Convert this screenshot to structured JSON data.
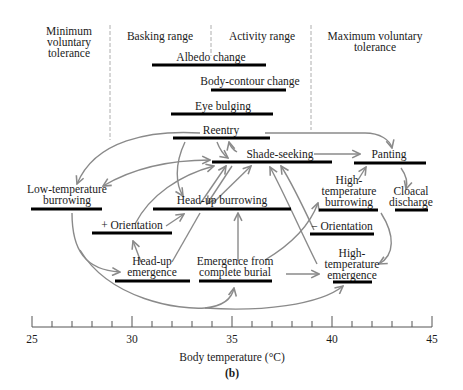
{
  "figure": {
    "panel_label": "(b)",
    "xlabel": "Body temperature (°C)",
    "axis": {
      "min": 25,
      "max": 45,
      "major_ticks": [
        25,
        30,
        35,
        40,
        45
      ],
      "minor_step": 1
    },
    "zones": [
      {
        "label_lines": [
          "Minimum",
          "voluntary",
          "tolerance"
        ],
        "range": "<29"
      },
      {
        "label_lines": [
          "Basking range"
        ],
        "range": "29-34"
      },
      {
        "label_lines": [
          "Activity range"
        ],
        "range": "34-39"
      },
      {
        "label_lines": [
          "Maximum voluntary",
          "tolerance"
        ],
        "range": ">39"
      }
    ],
    "behaviors": [
      {
        "id": "albedo",
        "label_lines": [
          "Albedo change"
        ],
        "start": 31.0,
        "end": 36.7
      },
      {
        "id": "body_contour",
        "label_lines": [
          "Body-contour change"
        ],
        "start": 34.0,
        "end": 37.7
      },
      {
        "id": "eye_bulging",
        "label_lines": [
          "Eye bulging"
        ],
        "start": 32.0,
        "end": 37.0
      },
      {
        "id": "reentry",
        "label_lines": [
          "Reentry"
        ],
        "start": 32.0,
        "end": 36.9
      },
      {
        "id": "shade_seeking",
        "label_lines": [
          "Shade-seeking"
        ],
        "start": 34.0,
        "end": 40.0
      },
      {
        "id": "panting",
        "label_lines": [
          "Panting"
        ],
        "start": 41.1,
        "end": 44.7
      },
      {
        "id": "low_temp_burrowing",
        "label_lines": [
          "Low-temperature",
          "burrowing"
        ],
        "start": 25.0,
        "end": 28.5
      },
      {
        "id": "head_up_burrowing",
        "label_lines": [
          "Head-up burrowing"
        ],
        "start": 31.0,
        "end": 37.9
      },
      {
        "id": "high_temp_burrowing",
        "label_lines": [
          "High-",
          "temperature",
          "burrowing"
        ],
        "start": 39.4,
        "end": 42.3
      },
      {
        "id": "cloacal_discharge",
        "label_lines": [
          "Cloacal",
          "discharge"
        ],
        "start": 43.2,
        "end": 44.8
      },
      {
        "id": "plus_orientation",
        "label_lines": [
          "+ Orientation"
        ],
        "start": 28.0,
        "end": 32.0
      },
      {
        "id": "minus_orientation",
        "label_lines": [
          "− Orientation"
        ],
        "start": 38.9,
        "end": 42.1
      },
      {
        "id": "head_up_emergence",
        "label_lines": [
          "Head-up",
          "emergence"
        ],
        "start": 29.1,
        "end": 32.9
      },
      {
        "id": "emergence_burial",
        "label_lines": [
          "Emergence from",
          "complete burial"
        ],
        "start": 33.3,
        "end": 37.0
      },
      {
        "id": "high_temp_emergence",
        "label_lines": [
          "High-",
          "temperature",
          "emergence"
        ],
        "start": 40.0,
        "end": 42.0
      }
    ],
    "transitions": [
      [
        "reentry",
        "low_temp_burrowing"
      ],
      [
        "reentry",
        "head_up_burrowing"
      ],
      [
        "reentry",
        "shade_seeking"
      ],
      [
        "reentry",
        "panting"
      ],
      [
        "shade_seeking",
        "reentry"
      ],
      [
        "shade_seeking",
        "low_temp_burrowing"
      ],
      [
        "shade_seeking",
        "panting"
      ],
      [
        "shade_seeking",
        "head_up_burrowing"
      ],
      [
        "head_up_burrowing",
        "shade_seeking"
      ],
      [
        "plus_orientation",
        "shade_seeking"
      ],
      [
        "plus_orientation",
        "head_up_burrowing"
      ],
      [
        "head_up_emergence",
        "plus_orientation"
      ],
      [
        "head_up_emergence",
        "shade_seeking"
      ],
      [
        "emergence_burial",
        "head_up_burrowing"
      ],
      [
        "emergence_burial",
        "high_temp_burrowing"
      ],
      [
        "emergence_burial",
        "high_temp_emergence"
      ],
      [
        "minus_orientation",
        "shade_seeking"
      ],
      [
        "high_temp_emergence",
        "shade_seeking"
      ],
      [
        "high_temp_burrowing",
        "panting"
      ],
      [
        "high_temp_burrowing",
        "high_temp_emergence"
      ],
      [
        "panting",
        "cloacal_discharge"
      ],
      [
        "low_temp_burrowing",
        "head_up_emergence"
      ],
      [
        "low_temp_burrowing",
        "emergence_burial"
      ],
      [
        "low_temp_burrowing",
        "high_temp_emergence"
      ]
    ]
  }
}
